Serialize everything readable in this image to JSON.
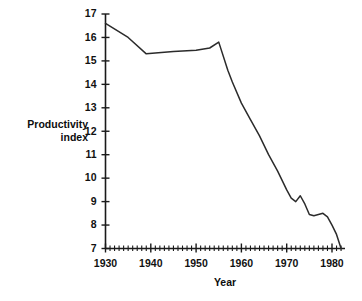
{
  "chart_data": {
    "type": "line",
    "title": "",
    "xlabel": "Year",
    "ylabel": "Productivity index",
    "ylabel_lines": [
      "Productivity",
      "index"
    ],
    "xlim": [
      1930,
      1982
    ],
    "ylim": [
      7,
      17
    ],
    "grid": false,
    "legend": null,
    "x_ticks": [
      1930,
      1940,
      1950,
      1960,
      1970,
      1980
    ],
    "x_tick_labels": [
      "1930",
      "1940",
      "1950",
      "1960",
      "1970",
      "1980"
    ],
    "x_minor_tick_step": 1,
    "y_ticks": [
      7,
      8,
      9,
      10,
      11,
      12,
      13,
      14,
      15,
      16,
      17
    ],
    "y_tick_labels": [
      "7",
      "8",
      "9",
      "10",
      "11",
      "12",
      "13",
      "14",
      "15",
      "16",
      "17"
    ],
    "line_color": "#2b2b2b",
    "series": [
      {
        "name": "Productivity index",
        "x": [
          1930,
          1935,
          1939,
          1945,
          1950,
          1953,
          1955,
          1957,
          1958,
          1960,
          1962,
          1964,
          1966,
          1968,
          1970,
          1971,
          1972,
          1973,
          1974,
          1975,
          1976,
          1977,
          1978,
          1979,
          1980,
          1981,
          1982
        ],
        "values": [
          16.6,
          16.0,
          15.3,
          15.4,
          15.45,
          15.55,
          15.8,
          14.6,
          14.1,
          13.2,
          12.5,
          11.8,
          11.0,
          10.3,
          9.5,
          9.15,
          9.0,
          9.25,
          8.9,
          8.45,
          8.4,
          8.45,
          8.5,
          8.35,
          8.0,
          7.6,
          7.0
        ]
      }
    ]
  },
  "axis_titles": {
    "x": "Year",
    "y_line1": "Productivity",
    "y_line2": "index"
  }
}
